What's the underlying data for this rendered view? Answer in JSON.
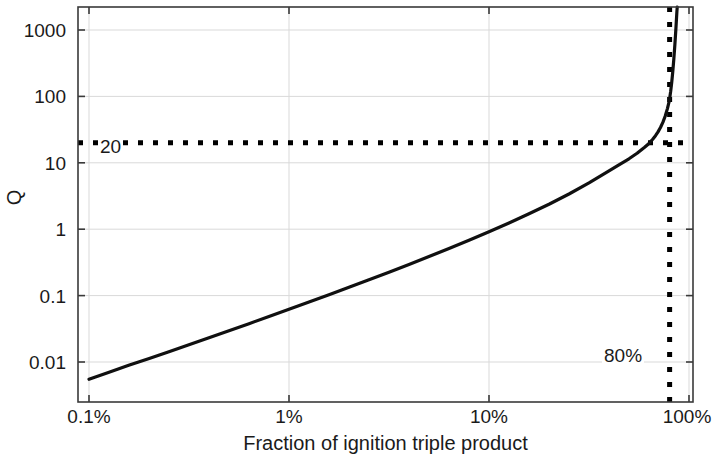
{
  "chart_data": {
    "type": "line",
    "title": "",
    "xlabel": "Fraction of ignition triple product",
    "ylabel": "Q",
    "xscale": "log",
    "yscale": "log",
    "xlim": [
      0.001,
      1.0
    ],
    "ylim": [
      0.004,
      3000
    ],
    "xticks": [
      "0.1%",
      "1%",
      "10%",
      "100%"
    ],
    "xtick_values": [
      0.001,
      0.01,
      0.1,
      1.0
    ],
    "yticks": [
      "1000",
      "100",
      "10",
      "1",
      "0.1",
      "0.01"
    ],
    "ytick_values": [
      1000,
      100,
      10,
      1,
      0.1,
      0.01
    ],
    "grid": true,
    "legend": "none",
    "series": [
      {
        "name": "Q vs fraction of ignition triple product",
        "color": "#101010",
        "x": [
          0.001,
          0.00126,
          0.00158,
          0.002,
          0.00251,
          0.00316,
          0.00398,
          0.00501,
          0.00631,
          0.00794,
          0.01,
          0.01259,
          0.01585,
          0.01995,
          0.02512,
          0.03162,
          0.03981,
          0.05012,
          0.0631,
          0.07943,
          0.1,
          0.12589,
          0.15849,
          0.19953,
          0.25119,
          0.31623,
          0.39811,
          0.44,
          0.50119,
          0.55,
          0.6,
          0.63096,
          0.66,
          0.68,
          0.7,
          0.72,
          0.74,
          0.76,
          0.78,
          0.79433,
          0.8,
          0.81,
          0.82,
          0.83,
          0.84,
          0.85,
          0.86,
          0.87,
          0.88
        ],
        "y": [
          0.0055,
          0.007,
          0.0089,
          0.0113,
          0.0143,
          0.0182,
          0.0232,
          0.0296,
          0.0378,
          0.0484,
          0.0621,
          0.0799,
          0.1031,
          0.1334,
          0.1731,
          0.2254,
          0.2947,
          0.3873,
          0.5118,
          0.6815,
          0.9152,
          1.242,
          1.706,
          2.38,
          3.39,
          4.97,
          7.56,
          9.1,
          11.5,
          13.9,
          17.1,
          19.5,
          22.8,
          25.6,
          29.2,
          34.0,
          40.6,
          50.2,
          65.5,
          82.0,
          92.0,
          120.0,
          165.0,
          240.0,
          370.0,
          600.0,
          1050.0,
          1900.0,
          3000.0
        ]
      }
    ],
    "annotations": [
      {
        "name": "q-threshold-line",
        "label": "20",
        "orientation": "horizontal",
        "value": 20,
        "style": "dotted",
        "color": "#000000"
      },
      {
        "name": "fraction-threshold-line",
        "label": "80%",
        "orientation": "vertical",
        "value": 0.8,
        "style": "dotted",
        "color": "#000000"
      }
    ]
  },
  "axis": {
    "ylabel": "Q",
    "xlabel": "Fraction of ignition triple product",
    "ytick_labels": [
      "1000",
      "100",
      "10",
      "1",
      "0.1",
      "0.01"
    ],
    "xtick_labels": [
      "0.1%",
      "1%",
      "10%",
      "100%"
    ]
  },
  "annotations": {
    "q_threshold": "20",
    "fraction_threshold": "80%"
  },
  "colors": {
    "curve": "#101010",
    "axis": "#3a3a3a",
    "grid": "#d8d8d8",
    "annotation": "#000000",
    "background": "#ffffff"
  }
}
